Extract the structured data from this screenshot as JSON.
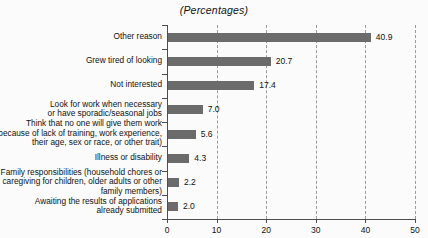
{
  "chart_data": {
    "type": "bar",
    "orientation": "horizontal",
    "title": "(Percentages)",
    "xlabel": "",
    "ylabel": "",
    "xlim": [
      0,
      50
    ],
    "xticks": [
      0,
      10,
      20,
      30,
      40,
      50
    ],
    "xtick_labels": [
      "0",
      "10",
      "20",
      "30",
      "40",
      "50"
    ],
    "grid": "vertical-dashed",
    "legend": "none",
    "bar_color": "#6b6b6b",
    "categories": [
      "Other reason",
      "Grew tired of looking",
      "Not interested",
      "Look for work when necessary\nor have sporadic/seasonal jobs",
      "Think that no one will give them work\n(because of lack of training, work experience,\ntheir age, sex or race, or other trait)",
      "Illness or disability",
      "Family responsibilities (household chores or\ncaregiving for children, older adults or other\nfamily members)",
      "Awaiting the results of applications\nalready submitted"
    ],
    "values": [
      40.9,
      20.7,
      17.4,
      7.0,
      5.6,
      4.3,
      2.2,
      2.0
    ],
    "value_labels": [
      "40.9",
      "20.7",
      "17.4",
      "7.0",
      "5.6",
      "4.3",
      "2.2",
      "2.0"
    ]
  }
}
